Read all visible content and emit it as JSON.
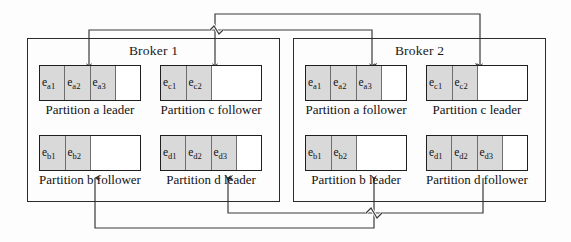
{
  "diagram": {
    "brokers": [
      {
        "name": "Broker 1",
        "partitions": [
          {
            "id": "partition-a-leader",
            "caption": "Partition a leader",
            "cells": [
              "e a1",
              "e a2",
              "e a3"
            ],
            "cell_labels": [
              {
                "base": "e",
                "sub": "a1"
              },
              {
                "base": "e",
                "sub": "a2"
              },
              {
                "base": "e",
                "sub": "a3"
              }
            ],
            "total_slots": 4,
            "filled": 3,
            "role": "leader"
          },
          {
            "id": "partition-c-follower",
            "caption": "Partition c follower",
            "cells": [
              "e c1",
              "e c2"
            ],
            "cell_labels": [
              {
                "base": "e",
                "sub": "c1"
              },
              {
                "base": "e",
                "sub": "c2"
              }
            ],
            "total_slots": 4,
            "filled": 2,
            "role": "follower"
          },
          {
            "id": "partition-b-follower",
            "caption": "Partition b follower",
            "cells": [
              "e b1",
              "e b2"
            ],
            "cell_labels": [
              {
                "base": "e",
                "sub": "b1"
              },
              {
                "base": "e",
                "sub": "b2"
              }
            ],
            "total_slots": 4,
            "filled": 2,
            "role": "follower"
          },
          {
            "id": "partition-d-leader",
            "caption": "Partition d leader",
            "cells": [
              "e d1",
              "e d2",
              "e d3"
            ],
            "cell_labels": [
              {
                "base": "e",
                "sub": "d1"
              },
              {
                "base": "e",
                "sub": "d2"
              },
              {
                "base": "e",
                "sub": "d3"
              }
            ],
            "total_slots": 4,
            "filled": 3,
            "role": "leader"
          }
        ]
      },
      {
        "name": "Broker 2",
        "partitions": [
          {
            "id": "partition-a-follower",
            "caption": "Partition a follower",
            "cells": [
              "e a1",
              "e a2",
              "e a3"
            ],
            "cell_labels": [
              {
                "base": "e",
                "sub": "a1"
              },
              {
                "base": "e",
                "sub": "a2"
              },
              {
                "base": "e",
                "sub": "a3"
              }
            ],
            "total_slots": 4,
            "filled": 3,
            "role": "follower"
          },
          {
            "id": "partition-c-leader",
            "caption": "Partition c leader",
            "cells": [
              "e c1",
              "e c2"
            ],
            "cell_labels": [
              {
                "base": "e",
                "sub": "c1"
              },
              {
                "base": "e",
                "sub": "c2"
              }
            ],
            "total_slots": 4,
            "filled": 2,
            "role": "leader"
          },
          {
            "id": "partition-b-leader",
            "caption": "Partition b leader",
            "cells": [
              "e b1",
              "e b2"
            ],
            "cell_labels": [
              {
                "base": "e",
                "sub": "b1"
              },
              {
                "base": "e",
                "sub": "b2"
              }
            ],
            "total_slots": 4,
            "filled": 2,
            "role": "leader"
          },
          {
            "id": "partition-d-follower",
            "caption": "Partition d follower",
            "cells": [
              "e d1",
              "e d2",
              "e d3"
            ],
            "cell_labels": [
              {
                "base": "e",
                "sub": "d1"
              },
              {
                "base": "e",
                "sub": "d2"
              },
              {
                "base": "e",
                "sub": "d3"
              }
            ],
            "total_slots": 4,
            "filled": 3,
            "role": "follower"
          }
        ]
      }
    ],
    "replication_links": [
      {
        "id": "link-c-leader-to-c-follower",
        "from": "partition-c-leader",
        "to": "partition-c-follower",
        "route": "top"
      },
      {
        "id": "link-a-leader-to-a-follower",
        "from": "partition-a-leader",
        "to": "partition-a-follower",
        "route": "top"
      },
      {
        "id": "link-d-leader-to-d-follower",
        "from": "partition-d-leader",
        "to": "partition-d-follower",
        "route": "bottom"
      },
      {
        "id": "link-b-leader-to-b-follower",
        "from": "partition-b-leader",
        "to": "partition-b-follower",
        "route": "bottom"
      }
    ],
    "colors": {
      "stroke": "#2b2b2b",
      "wire": "#3a3a3a",
      "cell_fill": "#d9d9d9",
      "background": "#fdfdfd"
    }
  }
}
